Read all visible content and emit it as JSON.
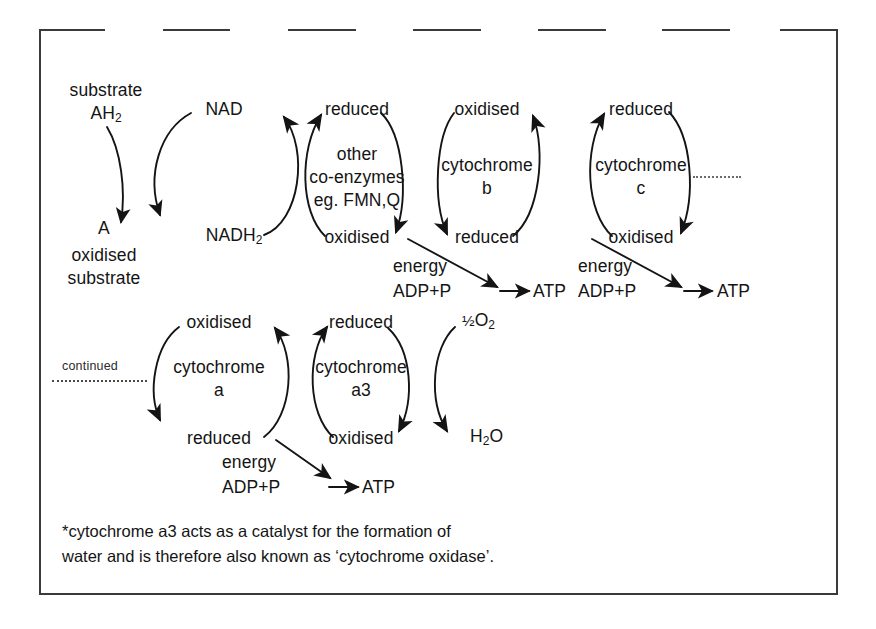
{
  "figure": {
    "type": "biochemistry-flow-diagram",
    "frame": {
      "top_border_style": "segmented-dashed",
      "top_segments": 7,
      "other_borders": "solid",
      "border_color": "#3a3a3c"
    }
  },
  "row1": {
    "substrate": {
      "top_line": "substrate",
      "top_formula_base": "AH",
      "top_formula_sub": "2",
      "bottom_letter": "A",
      "bottom_line1": "oxidised",
      "bottom_line2": "substrate"
    },
    "nad_cycle": {
      "top": "NAD",
      "bottom_base": "NADH",
      "bottom_sub": "2"
    },
    "coenzyme_cycle": {
      "top": "reduced",
      "center_line1": "other",
      "center_line2": "co-enzymes",
      "center_line3": "eg. FMN,Q",
      "bottom": "oxidised"
    },
    "cytochrome_b_cycle": {
      "top": "oxidised",
      "center_line1": "cytochrome",
      "center_line2": "b",
      "bottom": "reduced"
    },
    "cytochrome_c_cycle": {
      "top": "reduced",
      "center_line1": "cytochrome",
      "center_line2": "c",
      "bottom": "oxidised"
    },
    "atp_step_1": {
      "energy": "energy",
      "reactants": "ADP+P",
      "product": "ATP"
    },
    "atp_step_2": {
      "energy": "energy",
      "reactants": "ADP+P",
      "product": "ATP"
    }
  },
  "row2": {
    "continued_label": "continued",
    "cytochrome_a_cycle": {
      "top": "oxidised",
      "center_line1": "cytochrome",
      "center_line2": "a",
      "bottom": "reduced"
    },
    "cytochrome_a3_cycle": {
      "top": "reduced",
      "center_line1": "cytochrome",
      "center_line2": "a3",
      "bottom": "oxidised"
    },
    "oxygen_cycle": {
      "top_frac": "½",
      "top_base": "O",
      "top_sub": "2",
      "bottom_base_1": "H",
      "bottom_sub": "2",
      "bottom_base_2": "O"
    },
    "atp_step_3": {
      "energy": "energy",
      "reactants": "ADP+P",
      "product": "ATP"
    }
  },
  "footnote": {
    "line1": "*cytochrome a3 acts as a catalyst for the formation of",
    "line2": "water and is therefore also known as ‘cytochrome oxidase’."
  }
}
